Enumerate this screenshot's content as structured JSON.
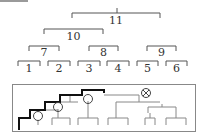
{
  "header_bar": {
    "color": "#9a9a9a"
  },
  "tree": {
    "line_color": "#555555",
    "nodes": [
      {
        "id": "11",
        "label": "11",
        "x1": 72,
        "x2": 160,
        "y": 13,
        "label_y": 24
      },
      {
        "id": "10",
        "label": "10",
        "x1": 44,
        "x2": 103,
        "y": 29,
        "label_y": 40
      },
      {
        "id": "7",
        "label": "7",
        "x1": 29,
        "x2": 59,
        "y": 46,
        "label_y": 56
      },
      {
        "id": "8",
        "label": "8",
        "x1": 89,
        "x2": 118,
        "y": 46,
        "label_y": 56
      },
      {
        "id": "9",
        "label": "9",
        "x1": 147,
        "x2": 176,
        "y": 46,
        "label_y": 56
      },
      {
        "id": "1",
        "label": "1",
        "x1": 18,
        "x2": 40,
        "y": 61,
        "label_y": 72
      },
      {
        "id": "2",
        "label": "2",
        "x1": 48,
        "x2": 70,
        "y": 61,
        "label_y": 72
      },
      {
        "id": "3",
        "label": "3",
        "x1": 78,
        "x2": 100,
        "y": 61,
        "label_y": 72
      },
      {
        "id": "4",
        "label": "4",
        "x1": 107,
        "x2": 129,
        "y": 61,
        "label_y": 72
      },
      {
        "id": "5",
        "label": "5",
        "x1": 137,
        "x2": 158,
        "y": 61,
        "label_y": 72
      },
      {
        "id": "6",
        "label": "6",
        "x1": 166,
        "x2": 187,
        "y": 61,
        "label_y": 72
      }
    ]
  },
  "inset": {
    "box": {
      "x": 12,
      "y": 84,
      "w": 183,
      "h": 48
    },
    "highlight_color": "#111111",
    "normal_color": "#777777",
    "circle_markers": 3,
    "cross_marker": "⊗"
  }
}
